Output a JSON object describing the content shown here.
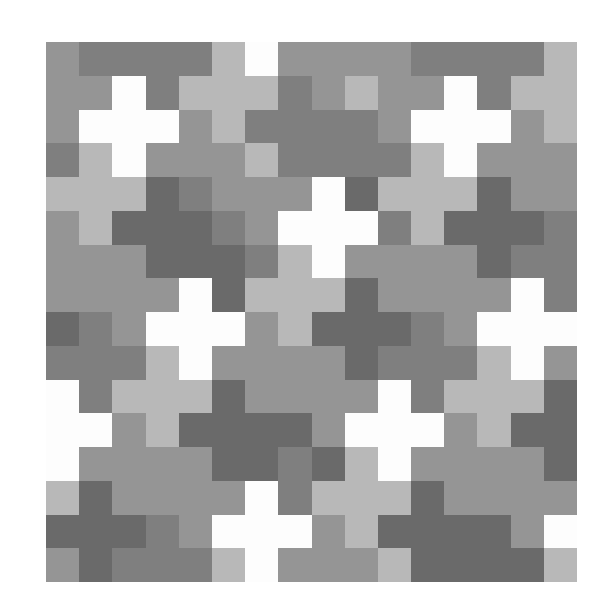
{
  "mosaic": {
    "cols": 16,
    "rows": 16,
    "palette": {
      "W": "#fdfdfd",
      "L": "#b8b8b8",
      "M": "#959595",
      "D": "#7f7f7f",
      "K": "#6a6a6a"
    },
    "grid": [
      "MDDDDLWMMMMDDDDL",
      "MMWDLLLDMLMMWDLL",
      "MWWWMLDDDDMWWWML",
      "DLWMMMLDDDDLWMMM",
      "LLLKDMMMWKLLLKMM",
      "MLKKKDMWWWDLKKKD",
      "MMMKKKDLWMMMMKDD",
      "MMMMWKLLLKMMMMWD",
      "KDMWWWMLKKKDMWWW",
      "DDDLWMMMMKDDDLWM",
      "WDLLLKMMMMWDLLLK",
      "WWMLKKKKMWWWMLKK",
      "WMMMMKKDKLWMMMMK",
      "LKMMMMWDLLLKMMMM",
      "KKKDMWWWMLKKKKMW",
      "MKDDDLWMMMLKKKKL"
    ]
  }
}
